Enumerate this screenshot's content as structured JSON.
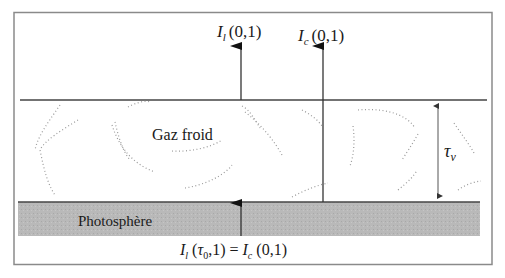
{
  "diagram": {
    "top_labels": {
      "line_intensity": {
        "symbol": "I",
        "sub": "l",
        "args": "(0,1)"
      },
      "continuum_intensity": {
        "symbol": "I",
        "sub": "c",
        "args": "(0,1)"
      }
    },
    "regions": {
      "cold_gas": "Gaz froid",
      "photosphere": "Photosphère"
    },
    "optical_depth": {
      "symbol": "τ",
      "sub": "ν"
    },
    "bottom_equation": {
      "lhs_symbol": "I",
      "lhs_sub": "l",
      "lhs_open": " (",
      "lhs_tau": "τ",
      "lhs_tau_sub": "0",
      "lhs_close": ",1) = ",
      "rhs_symbol": "I",
      "rhs_sub": "c",
      "rhs_args": " (0,1)"
    },
    "colors": {
      "frame": "#8a8a8a",
      "line": "#444444",
      "photosphere_fill": "#b9b9b9",
      "dots": "#9a9a9a"
    }
  }
}
